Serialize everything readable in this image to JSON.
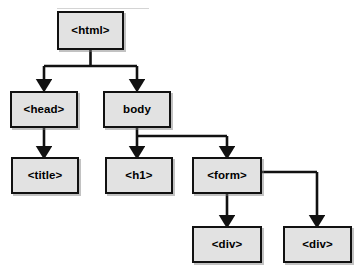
{
  "diagram": {
    "type": "tree",
    "title_fragment": "",
    "canvas": {
      "width": 358,
      "height": 275,
      "background": "#ffffff"
    },
    "style": {
      "node_fill": "#e2e2e2",
      "node_border": "#111111",
      "edge_color": "#111111",
      "shadow": "#787878"
    },
    "nodes": [
      {
        "id": "html",
        "label": "<html>",
        "x": 57,
        "y": 11,
        "w": 67,
        "h": 39
      },
      {
        "id": "head",
        "label": "<head>",
        "x": 10,
        "y": 91,
        "w": 68,
        "h": 37
      },
      {
        "id": "body",
        "label": "body",
        "x": 103,
        "y": 91,
        "w": 68,
        "h": 37
      },
      {
        "id": "title",
        "label": "<title>",
        "x": 11,
        "y": 157,
        "w": 68,
        "h": 37
      },
      {
        "id": "h1",
        "label": "<h1>",
        "x": 105,
        "y": 157,
        "w": 68,
        "h": 37
      },
      {
        "id": "form",
        "label": "<form>",
        "x": 192,
        "y": 157,
        "w": 70,
        "h": 37
      },
      {
        "id": "div1",
        "label": "<div>",
        "x": 192,
        "y": 226,
        "w": 70,
        "h": 37
      },
      {
        "id": "div2",
        "label": "<div>",
        "x": 283,
        "y": 226,
        "w": 69,
        "h": 37
      }
    ],
    "edges": [
      {
        "from": "html",
        "to": "head"
      },
      {
        "from": "html",
        "to": "body"
      },
      {
        "from": "body",
        "to": "h1"
      },
      {
        "from": "body",
        "to": "form"
      },
      {
        "from": "form",
        "to": "div1"
      },
      {
        "from": "head",
        "to": "title"
      },
      {
        "from": "form",
        "to": "div2"
      }
    ]
  }
}
